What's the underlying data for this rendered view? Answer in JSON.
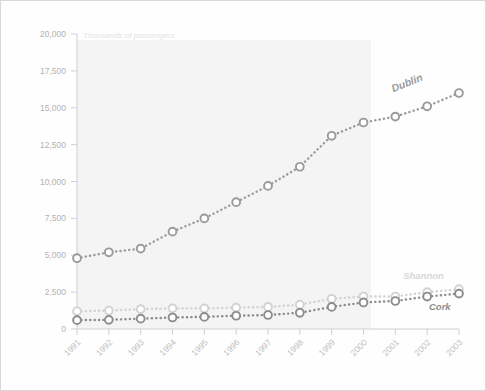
{
  "chart_data": {
    "type": "line",
    "title": "",
    "subtitle": "Thousands of passengers",
    "xlabel": "",
    "ylabel": "",
    "ylim": [
      0,
      20000
    ],
    "yticks": [
      "0",
      "2,500",
      "5,000",
      "7,500",
      "10,000",
      "12,500",
      "15,000",
      "17,500",
      "20,000"
    ],
    "ytick_values": [
      0,
      2500,
      5000,
      7500,
      10000,
      12500,
      15000,
      17500,
      20000
    ],
    "grid": false,
    "legend_position": "inline-right",
    "categories": [
      "1991",
      "1992",
      "1993",
      "1994",
      "1995",
      "1996",
      "1997",
      "1998",
      "1999",
      "2000",
      "2001",
      "2002",
      "2003"
    ],
    "series": [
      {
        "name": "Dublin",
        "color": "#9a9a9a",
        "label_color": "#9a9a9a",
        "values": [
          4800,
          5200,
          5450,
          6600,
          7500,
          8600,
          9700,
          11000,
          13100,
          14000,
          14400,
          15100,
          16000
        ]
      },
      {
        "name": "Shannon",
        "color": "#d2d2d2",
        "label_color": "#d8d8d8",
        "values": [
          1200,
          1250,
          1350,
          1400,
          1400,
          1450,
          1500,
          1650,
          2050,
          2200,
          2200,
          2500,
          2700
        ]
      },
      {
        "name": "Cork",
        "color": "#8c8c8c",
        "label_color": "#8c8c8c",
        "values": [
          600,
          620,
          700,
          780,
          820,
          900,
          950,
          1100,
          1500,
          1800,
          1900,
          2200,
          2400
        ]
      }
    ]
  },
  "colors": {
    "plot_band": "#f4f4f4",
    "axis": "#d0d0d0",
    "tick_text": "#b8b8b8",
    "frame_border": "#d8d8d8"
  }
}
